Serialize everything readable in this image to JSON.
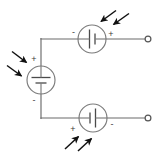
{
  "diagram": {
    "canvas": {
      "width": 165,
      "height": 154
    },
    "colors": {
      "background": "#ffffff",
      "wire": "#6b6b6b",
      "component_outline": "#7a7a7a",
      "plate": "#4a4a4a",
      "arrow": "#111111",
      "label": "#3a3a3a"
    },
    "sources": [
      {
        "id": "top-source",
        "name": "top-voltage-source",
        "orientation": "horizontal",
        "center": {
          "x": 92,
          "y": 39
        },
        "radius": 14,
        "left_terminal_label": "-",
        "right_terminal_label": "+",
        "symbol": "battery-cell",
        "illumination": "light-arrows-incident-from-upper-right"
      },
      {
        "id": "middle-source",
        "name": "left-voltage-source",
        "orientation": "vertical",
        "center": {
          "x": 41,
          "y": 80
        },
        "radius": 14,
        "top_terminal_label": "+",
        "bottom_terminal_label": "-",
        "symbol": "battery-cell",
        "illumination": "light-arrows-incident-from-upper-left"
      },
      {
        "id": "bottom-source",
        "name": "bottom-voltage-source",
        "orientation": "horizontal",
        "center": {
          "x": 93,
          "y": 118
        },
        "radius": 14,
        "left_terminal_label": "+",
        "right_terminal_label": "-",
        "symbol": "battery-cell",
        "illumination": "light-arrows-incident-from-lower-left"
      }
    ],
    "terminals": [
      {
        "id": "top-terminal",
        "name": "output-terminal-top",
        "x": 148,
        "y": 39,
        "radius": 3
      },
      {
        "id": "bottom-terminal",
        "name": "output-terminal-bottom",
        "x": 148,
        "y": 118,
        "radius": 3
      }
    ],
    "wires": [
      {
        "id": "top-wire-left",
        "from": {
          "x": 41,
          "y": 39
        },
        "to": {
          "x": 78,
          "y": 39
        }
      },
      {
        "id": "top-wire-right",
        "from": {
          "x": 106,
          "y": 39
        },
        "to": {
          "x": 145,
          "y": 39
        }
      },
      {
        "id": "left-wire-upper",
        "from": {
          "x": 41,
          "y": 39
        },
        "to": {
          "x": 41,
          "y": 66
        }
      },
      {
        "id": "left-wire-lower",
        "from": {
          "x": 41,
          "y": 94
        },
        "to": {
          "x": 41,
          "y": 118
        }
      },
      {
        "id": "bottom-wire-left",
        "from": {
          "x": 41,
          "y": 118
        },
        "to": {
          "x": 79,
          "y": 118
        }
      },
      {
        "id": "bottom-wire-right",
        "from": {
          "x": 107,
          "y": 118
        },
        "to": {
          "x": 145,
          "y": 118
        }
      }
    ],
    "light_arrow_groups": [
      {
        "id": "top-light",
        "name": "light-arrows-top-source",
        "direction": "down-left",
        "arrows": [
          {
            "x1": 115,
            "y1": 11,
            "x2": 100,
            "y2": 22
          },
          {
            "x1": 128,
            "y1": 14,
            "x2": 112,
            "y2": 25
          }
        ]
      },
      {
        "id": "middle-light",
        "name": "light-arrows-left-source",
        "direction": "down-right",
        "arrows": [
          {
            "x1": 13,
            "y1": 52,
            "x2": 27,
            "y2": 63
          },
          {
            "x1": 8,
            "y1": 66,
            "x2": 22,
            "y2": 76
          }
        ]
      },
      {
        "id": "bottom-light",
        "name": "light-arrows-bottom-source",
        "direction": "up-right",
        "arrows": [
          {
            "x1": 66,
            "y1": 148,
            "x2": 79,
            "y2": 136
          },
          {
            "x1": 79,
            "y1": 150,
            "x2": 92,
            "y2": 138
          }
        ]
      }
    ]
  }
}
